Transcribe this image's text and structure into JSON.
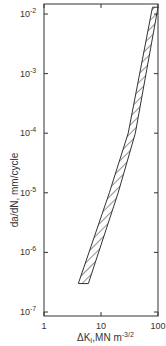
{
  "chart_data": {
    "type": "area",
    "title": "",
    "xlabel": "ΔK_I, MN m^-3/2",
    "ylabel": "da/dN, mm/cycle",
    "xscale": "log",
    "yscale": "log",
    "xlim": [
      1,
      100
    ],
    "ylim": [
      1e-07,
      0.013
    ],
    "x_ticks": [
      {
        "value": 1,
        "label": "1"
      },
      {
        "value": 10,
        "label": "10"
      },
      {
        "value": 100,
        "label": "100"
      }
    ],
    "y_ticks": [
      {
        "value": 0.01,
        "base": "10",
        "exp": "-2"
      },
      {
        "value": 0.001,
        "base": "10",
        "exp": "-3"
      },
      {
        "value": 0.0001,
        "base": "10",
        "exp": "-4"
      },
      {
        "value": 1e-05,
        "base": "10",
        "exp": "-5"
      },
      {
        "value": 1e-06,
        "base": "10",
        "exp": "-6"
      },
      {
        "value": 1e-07,
        "base": "10",
        "exp": "-7"
      }
    ],
    "grid": false,
    "legend": null,
    "series": [
      {
        "name": "scatter band (hatched)",
        "fill": "hatched",
        "lower_bound": {
          "x": [
            6.0,
            20,
            40,
            100
          ],
          "y": [
            3e-07,
            1e-05,
            0.0001,
            0.013
          ]
        },
        "upper_bound": {
          "x": [
            4.0,
            14,
            30,
            80
          ],
          "y": [
            3e-07,
            1e-05,
            0.0001,
            0.013
          ]
        }
      }
    ]
  },
  "axes": {
    "x_title_main": "ΔK",
    "x_title_sub": "I",
    "x_title_units": ",MN m",
    "x_title_exp": "-3/2",
    "y_title": "da/dN,  mm/cycle"
  }
}
